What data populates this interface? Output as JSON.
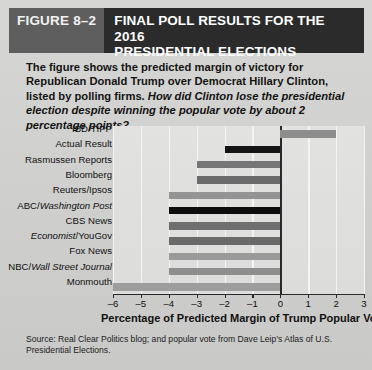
{
  "header": {
    "figure_tag": "FIGURE 8–2",
    "title": "FINAL POLL RESULTS FOR THE 2016\nPRESIDENTIAL ELECTIONS"
  },
  "caption": {
    "bold_part": "The figure shows the predicted margin of victory for Republican Donald Trump over Democrat Hillary Clinton, listed by polling firms.",
    "italic_part": " How did Clinton lose the presidential election despite winning the popular vote by about 2 percentage points?"
  },
  "source": {
    "text": "Source: Real Clear Politics blog; and popular vote from Dave Leip’s Atlas of U.S. Presidential Elections."
  },
  "colors": {
    "header_band": "#2b2b2b",
    "figure_tag_bg": "#5e5e5e",
    "page_bg": "#d2d2d0",
    "plot_bg": "#e0e0de",
    "bar_dark": "#0d0d0d",
    "bar_medium": "#6f6f6f",
    "bar_light": "#9a9a9a",
    "axis": "#2a2a2a",
    "gridline": "#f4f4f2"
  },
  "chart_data": {
    "type": "bar",
    "orientation": "horizontal",
    "title": "FINAL POLL RESULTS FOR THE 2016 PRESIDENTIAL ELECTIONS",
    "xlabel": "Percentage of Predicted Margin of Trump Popular Vote",
    "ylabel": "",
    "xlim": [
      -6,
      3
    ],
    "xticks": [
      -6,
      -5,
      -4,
      -3,
      -2,
      -1,
      0,
      1,
      2,
      3
    ],
    "xtick_labels": [
      "–6",
      "–5",
      "–4",
      "–3",
      "–2",
      "–1",
      "0",
      "1",
      "2",
      "3"
    ],
    "grid": true,
    "legend": "none",
    "categories": [
      "IBD/TIPP",
      "Actual Result",
      "Rasmussen Reports",
      "Bloomberg",
      "Reuters/Ipsos",
      "ABC/Washington Post",
      "CBS News",
      "Economist/YouGov",
      "Fox News",
      "NBC/Wall Street Journal",
      "Monmouth"
    ],
    "values": [
      2,
      -2,
      -3,
      -3,
      -4,
      -4,
      -4,
      -4,
      -4,
      -4,
      -6
    ],
    "bar_colors": [
      "#8d8d8d",
      "#141414",
      "#767676",
      "#6b6b6b",
      "#949494",
      "#0d0d0d",
      "#6f6f6f",
      "#6a6a6a",
      "#9a9a9a",
      "#8e8e8e",
      "#9d9d9d"
    ],
    "labels_italic_runs": [
      null,
      null,
      null,
      null,
      null,
      {
        "plain": "ABC/",
        "italic": "Washington Post"
      },
      null,
      {
        "italic": "Economist",
        "plain": "/YouGov"
      },
      null,
      {
        "plain": "NBC/",
        "italic": "Wall Street Journal"
      },
      null
    ]
  }
}
